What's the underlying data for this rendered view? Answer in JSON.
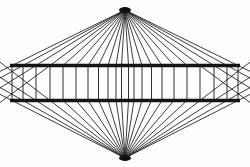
{
  "figure": {
    "name": "wundt-hering-illusion",
    "canvas": {
      "width": 250,
      "height": 167
    },
    "background_color": "#fdfdfd",
    "line_color": "#1a1a1a",
    "bar_color": "#141414"
  },
  "vertices": {
    "top": {
      "x": 125,
      "y": 10,
      "label": "top-vanishing-point"
    },
    "bottom": {
      "x": 125,
      "y": 158,
      "label": "bottom-vanishing-point"
    },
    "blob_radius_x": 6,
    "blob_radius_y": 3
  },
  "bars": [
    {
      "name": "upper-horizontal-bar",
      "x1": 10,
      "y1": 65.5,
      "x2": 240,
      "y2": 65.5,
      "thickness": 3.4,
      "color": "#141414"
    },
    {
      "name": "lower-horizontal-bar",
      "x1": 10,
      "y1": 100.5,
      "x2": 240,
      "y2": 100.5,
      "thickness": 3.4,
      "color": "#141414"
    }
  ],
  "band": {
    "name": "middle-band",
    "top_y": 65.5,
    "bottom_y": 100.5,
    "mid_y": 83.0
  },
  "rays": {
    "count_per_side": 11,
    "note": "Rays emanate from top and bottom vertices toward both bar lines; outermost rays terminate at the canvas left/right edges.",
    "upper_bar_crossings_left": [
      12.0,
      23.0,
      36.0,
      50.0,
      63.0,
      76.0,
      88.0,
      98.5,
      108.0,
      116.0,
      121.5
    ],
    "upper_bar_crossings_right": [
      238.0,
      227.0,
      214.0,
      200.0,
      187.0,
      174.0,
      162.0,
      151.5,
      142.0,
      134.0,
      128.5
    ],
    "outer_edge_points_upper_left": [
      {
        "x": 10,
        "y": 38
      },
      {
        "x": 10,
        "y": 56
      }
    ],
    "outer_edge_points_lower_left": [
      {
        "x": 10,
        "y": 110
      },
      {
        "x": 10,
        "y": 128
      }
    ]
  },
  "chevrons": {
    "count_per_side": 11,
    "note": "Inside the middle band each ray pair bends outward forming a chevron whose apex points away from the center.",
    "apex_x_left": [
      12.0,
      23.0,
      36.0,
      50.0,
      63.0,
      76.0,
      88.0,
      98.5,
      108.0,
      116.0,
      121.5
    ],
    "apex_x_right": [
      238.0,
      227.0,
      214.0,
      200.0,
      187.0,
      174.0,
      162.0,
      151.5,
      142.0,
      134.0,
      128.5
    ],
    "apex_y": 83.0
  }
}
